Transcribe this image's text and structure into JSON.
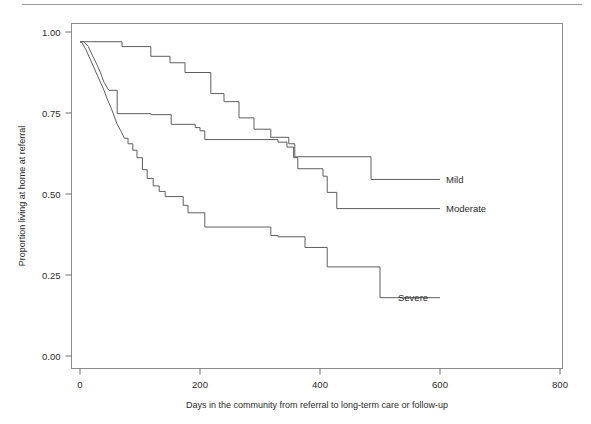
{
  "figure": {
    "rule_color": "#9a9a9a",
    "axis_color": "#8d8d8d",
    "curve_color": "#5e5e5e"
  },
  "chart_data": {
    "type": "line",
    "title": "",
    "subtitle": "",
    "xlabel": "Days in the community from referral to long-term care or follow-up",
    "ylabel": "Proportion living at home at referral",
    "xlim": [
      0,
      800
    ],
    "ylim": [
      0,
      1
    ],
    "xticks": [
      0,
      200,
      400,
      600,
      800
    ],
    "xticklabels": [
      "0",
      "200",
      "400",
      "600",
      "800"
    ],
    "yticks": [
      0,
      0.25,
      0.5,
      0.75,
      1
    ],
    "yticklabels": [
      "0.00",
      "0.25",
      "0.50",
      "0.75",
      "1.00"
    ],
    "grid": false,
    "legend_position": "right-inline-annotations",
    "step_style": "post",
    "series": [
      {
        "name": "Mild",
        "label": "Mild",
        "label_x": 600,
        "label_y": 0.545,
        "points": [
          [
            0,
            0.97
          ],
          [
            8,
            0.97
          ],
          [
            70,
            0.97
          ],
          [
            70,
            0.955
          ],
          [
            118,
            0.955
          ],
          [
            118,
            0.925
          ],
          [
            150,
            0.925
          ],
          [
            150,
            0.905
          ],
          [
            175,
            0.905
          ],
          [
            175,
            0.875
          ],
          [
            218,
            0.875
          ],
          [
            218,
            0.81
          ],
          [
            240,
            0.81
          ],
          [
            240,
            0.785
          ],
          [
            265,
            0.785
          ],
          [
            265,
            0.735
          ],
          [
            290,
            0.735
          ],
          [
            290,
            0.7
          ],
          [
            318,
            0.7
          ],
          [
            318,
            0.675
          ],
          [
            348,
            0.675
          ],
          [
            348,
            0.655
          ],
          [
            358,
            0.655
          ],
          [
            358,
            0.615
          ],
          [
            485,
            0.615
          ],
          [
            485,
            0.545
          ],
          [
            590,
            0.545
          ]
        ]
      },
      {
        "name": "Moderate",
        "label": "Moderate",
        "label_x": 600,
        "label_y": 0.455,
        "points": [
          [
            0,
            0.97
          ],
          [
            6,
            0.97
          ],
          [
            14,
            0.955
          ],
          [
            20,
            0.93
          ],
          [
            28,
            0.9
          ],
          [
            34,
            0.875
          ],
          [
            40,
            0.845
          ],
          [
            48,
            0.82
          ],
          [
            62,
            0.82
          ],
          [
            62,
            0.748
          ],
          [
            118,
            0.748
          ],
          [
            118,
            0.745
          ],
          [
            152,
            0.745
          ],
          [
            152,
            0.715
          ],
          [
            192,
            0.715
          ],
          [
            192,
            0.705
          ],
          [
            200,
            0.705
          ],
          [
            200,
            0.695
          ],
          [
            208,
            0.695
          ],
          [
            208,
            0.668
          ],
          [
            330,
            0.668
          ],
          [
            330,
            0.66
          ],
          [
            345,
            0.66
          ],
          [
            345,
            0.645
          ],
          [
            356,
            0.645
          ],
          [
            356,
            0.612
          ],
          [
            363,
            0.612
          ],
          [
            363,
            0.578
          ],
          [
            405,
            0.578
          ],
          [
            405,
            0.555
          ],
          [
            412,
            0.555
          ],
          [
            412,
            0.505
          ],
          [
            428,
            0.505
          ],
          [
            428,
            0.455
          ],
          [
            590,
            0.455
          ]
        ]
      },
      {
        "name": "Severe",
        "label": "Severe",
        "label_x": 520,
        "label_y": 0.18,
        "points": [
          [
            0,
            0.97
          ],
          [
            4,
            0.965
          ],
          [
            10,
            0.945
          ],
          [
            16,
            0.92
          ],
          [
            22,
            0.895
          ],
          [
            28,
            0.87
          ],
          [
            34,
            0.845
          ],
          [
            40,
            0.82
          ],
          [
            46,
            0.79
          ],
          [
            52,
            0.765
          ],
          [
            58,
            0.735
          ],
          [
            62,
            0.715
          ],
          [
            68,
            0.695
          ],
          [
            74,
            0.672
          ],
          [
            80,
            0.672
          ],
          [
            80,
            0.655
          ],
          [
            88,
            0.655
          ],
          [
            88,
            0.635
          ],
          [
            95,
            0.635
          ],
          [
            95,
            0.612
          ],
          [
            104,
            0.612
          ],
          [
            104,
            0.575
          ],
          [
            112,
            0.575
          ],
          [
            112,
            0.548
          ],
          [
            122,
            0.548
          ],
          [
            122,
            0.525
          ],
          [
            132,
            0.525
          ],
          [
            132,
            0.508
          ],
          [
            142,
            0.508
          ],
          [
            142,
            0.492
          ],
          [
            172,
            0.492
          ],
          [
            172,
            0.465
          ],
          [
            180,
            0.465
          ],
          [
            180,
            0.442
          ],
          [
            208,
            0.442
          ],
          [
            208,
            0.398
          ],
          [
            318,
            0.398
          ],
          [
            318,
            0.372
          ],
          [
            330,
            0.372
          ],
          [
            330,
            0.368
          ],
          [
            375,
            0.368
          ],
          [
            375,
            0.335
          ],
          [
            412,
            0.335
          ],
          [
            412,
            0.275
          ],
          [
            500,
            0.275
          ],
          [
            500,
            0.18
          ],
          [
            600,
            0.18
          ]
        ]
      }
    ]
  }
}
